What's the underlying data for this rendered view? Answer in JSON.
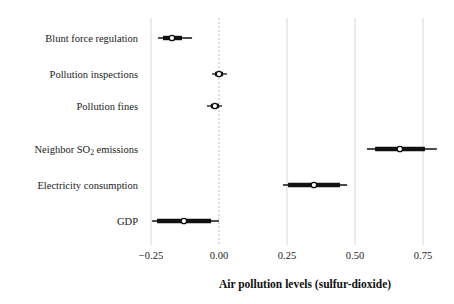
{
  "chart_data": {
    "type": "scatter",
    "subtype": "coefficient-plot-with-confidence-intervals",
    "title": "",
    "xlabel": "Air pollution levels (sulfur-dioxide)",
    "ylabel": "",
    "xlim": [
      -0.32,
      0.83
    ],
    "xticks": [
      -0.25,
      0.0,
      0.25,
      0.5,
      0.75
    ],
    "xtick_labels": [
      "−0.25",
      "0.00",
      "0.25",
      "0.50",
      "0.75"
    ],
    "grid": "vertical-gridlines-at-xticks",
    "zero_reference_line": 0.0,
    "zero_line_style": "dashed",
    "legend": "none",
    "marker": "open-circle",
    "categories": [
      "Blunt force regulation",
      "Pollution inspections",
      "Pollution fines",
      "Neighbor SO2 emissions",
      "Electricity consumption",
      "GDP"
    ],
    "points": [
      {
        "label": "Blunt force regulation",
        "label_main": "Blunt force regulation",
        "estimate": -0.173,
        "inner_low": -0.206,
        "inner_high": -0.136,
        "outer_low": -0.224,
        "outer_high": -0.099
      },
      {
        "label": "Pollution inspections",
        "label_main": "Pollution inspections",
        "estimate": 0.0,
        "inner_low": -0.015,
        "inner_high": 0.015,
        "outer_low": -0.026,
        "outer_high": 0.029
      },
      {
        "label": "Pollution fines",
        "label_main": "Pollution fines",
        "estimate": -0.015,
        "inner_low": -0.03,
        "inner_high": 0.0,
        "outer_low": -0.044,
        "outer_high": 0.011
      },
      {
        "label": "Neighbor SO2 emissions",
        "label_main": "Neighbor SO",
        "label_sub": "2",
        "label_tail": " emissions",
        "estimate": 0.665,
        "inner_low": 0.574,
        "inner_high": 0.757,
        "outer_low": 0.544,
        "outer_high": 0.801
      },
      {
        "label": "Electricity consumption",
        "label_main": "Electricity consumption",
        "estimate": 0.349,
        "inner_low": 0.254,
        "inner_high": 0.445,
        "outer_low": 0.235,
        "outer_high": 0.471
      },
      {
        "label": "GDP",
        "label_main": "GDP",
        "estimate": -0.129,
        "inner_low": -0.228,
        "inner_high": -0.029,
        "outer_low": -0.246,
        "outer_high": 0.0
      }
    ],
    "colors": {
      "interval": "#111111",
      "marker_fill": "#ffffff",
      "marker_stroke": "#111111",
      "gridline": "#d8d8d8",
      "zero_line": "#bdbdbd",
      "text": "#1a1a1a",
      "background": "#ffffff"
    }
  }
}
